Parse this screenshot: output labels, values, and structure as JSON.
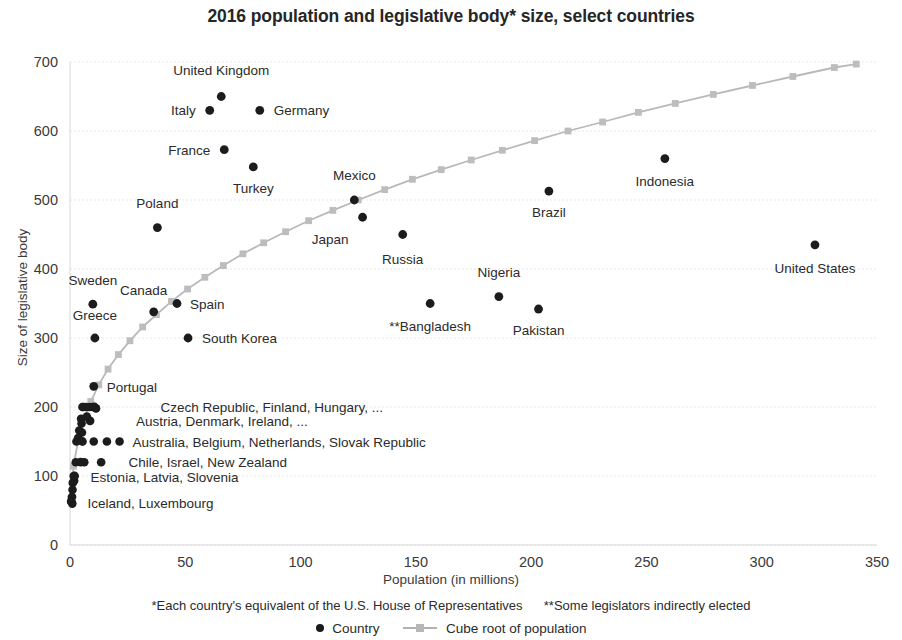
{
  "chart_data": {
    "type": "scatter",
    "title": "2016 population and legislative body* size, select countries",
    "xlabel": "Population (in millions)",
    "ylabel": "Size of legislative body",
    "xlim": [
      0,
      350
    ],
    "ylim": [
      0,
      700
    ],
    "xticks": [
      0,
      50,
      100,
      150,
      200,
      250,
      300,
      350
    ],
    "yticks": [
      0,
      100,
      200,
      300,
      400,
      500,
      600,
      700
    ],
    "grid": true,
    "legend_position": "bottom",
    "legend": [
      {
        "label": "Country",
        "marker": "dot",
        "color": "#1c1c1c"
      },
      {
        "label": "Cube root of population",
        "marker": "line-square",
        "color": "#bdbdbd"
      }
    ],
    "footnotes": [
      "*Each country's equivalent of the U.S. House of Representatives",
      "**Some legislators indirectly elected"
    ],
    "series": [
      {
        "name": "Country",
        "type": "scatter",
        "color": "#1c1c1c",
        "points": [
          {
            "label": "United Kingdom",
            "x": 65.6,
            "y": 650,
            "label_dx": 0,
            "label_dy": -22,
            "label_anchor": "middle"
          },
          {
            "label": "Italy",
            "x": 60.6,
            "y": 630,
            "label_dx": -14,
            "label_dy": 5,
            "label_anchor": "end"
          },
          {
            "label": "Germany",
            "x": 82.3,
            "y": 630,
            "label_dx": 14,
            "label_dy": 5,
            "label_anchor": "start"
          },
          {
            "label": "France",
            "x": 66.9,
            "y": 573,
            "label_dx": -14,
            "label_dy": 5,
            "label_anchor": "end"
          },
          {
            "label": "Turkey",
            "x": 79.5,
            "y": 548,
            "label_dx": 0,
            "label_dy": 26,
            "label_anchor": "middle"
          },
          {
            "label": "Poland",
            "x": 37.9,
            "y": 460,
            "label_dx": 0,
            "label_dy": -20,
            "label_anchor": "middle"
          },
          {
            "label": "Mexico",
            "x": 123.3,
            "y": 500,
            "label_dx": 0,
            "label_dy": -20,
            "label_anchor": "middle"
          },
          {
            "label": "Japan",
            "x": 126.9,
            "y": 475,
            "label_dx": -14,
            "label_dy": 27,
            "label_anchor": "end"
          },
          {
            "label": "Russia",
            "x": 144.3,
            "y": 450,
            "label_dx": 0,
            "label_dy": 29,
            "label_anchor": "middle"
          },
          {
            "label": "Brazil",
            "x": 207.7,
            "y": 513,
            "label_dx": 0,
            "label_dy": 26,
            "label_anchor": "middle"
          },
          {
            "label": "Indonesia",
            "x": 258.0,
            "y": 560,
            "label_dx": 0,
            "label_dy": 27,
            "label_anchor": "middle"
          },
          {
            "label": "United States",
            "x": 323.1,
            "y": 435,
            "label_dx": 0,
            "label_dy": 28,
            "label_anchor": "middle"
          },
          {
            "label": "Nigeria",
            "x": 186.0,
            "y": 360,
            "label_dx": 0,
            "label_dy": -20,
            "label_anchor": "middle"
          },
          {
            "label": "Pakistan",
            "x": 203.2,
            "y": 342,
            "label_dx": 0,
            "label_dy": 26,
            "label_anchor": "middle"
          },
          {
            "label": "**Bangladesh",
            "x": 156.2,
            "y": 350,
            "label_dx": 0,
            "label_dy": 27,
            "label_anchor": "middle"
          },
          {
            "label": "Sweden",
            "x": 9.9,
            "y": 349,
            "label_dx": 0,
            "label_dy": -19,
            "label_anchor": "middle"
          },
          {
            "label": "Canada",
            "x": 36.3,
            "y": 338,
            "label_dx": -10,
            "label_dy": -17,
            "label_anchor": "middle"
          },
          {
            "label": "Spain",
            "x": 46.4,
            "y": 350,
            "label_dx": 13,
            "label_dy": 5,
            "label_anchor": "start"
          },
          {
            "label": "Greece",
            "x": 10.8,
            "y": 300,
            "label_dx": 0,
            "label_dy": -18,
            "label_anchor": "middle"
          },
          {
            "label": "South Korea",
            "x": 51.2,
            "y": 300,
            "label_dx": 14,
            "label_dy": 5,
            "label_anchor": "start"
          },
          {
            "label": "Portugal",
            "x": 10.3,
            "y": 230,
            "label_dx": 13,
            "label_dy": 6,
            "label_anchor": "start"
          },
          {
            "label": "Czech Republic, Finland, Hungary, ...",
            "x": 10.6,
            "y": 200,
            "label_dx": 66,
            "label_dy": 5,
            "label_anchor": "start"
          },
          {
            "label": "Austria, Denmark, Ireland, ...",
            "x": 8.7,
            "y": 180,
            "label_dx": 46,
            "label_dy": 5,
            "label_anchor": "start"
          },
          {
            "label": "Australia, Belgium, Netherlands, Slovak Republic",
            "x": 5.4,
            "y": 150,
            "label_dx": 50,
            "label_dy": 5,
            "label_anchor": "start"
          },
          {
            "label": "Chile, Israel, New Zealand",
            "x": 4.6,
            "y": 120,
            "label_dx": 48,
            "label_dy": 5,
            "label_anchor": "start"
          },
          {
            "label": "Estonia, Latvia, Slovenia",
            "x": 2.0,
            "y": 100,
            "label_dx": 16,
            "label_dy": 6,
            "label_anchor": "start"
          },
          {
            "label": "Iceland, Luxembourg",
            "x": 0.6,
            "y": 63,
            "label_dx": 16,
            "label_dy": 6,
            "label_anchor": "start"
          }
        ],
        "extra_points": [
          {
            "x": 5.7,
            "y": 200
          },
          {
            "x": 5.4,
            "y": 200
          },
          {
            "x": 8.5,
            "y": 200
          },
          {
            "x": 9.9,
            "y": 200
          },
          {
            "x": 7.0,
            "y": 200
          },
          {
            "x": 11.3,
            "y": 198
          },
          {
            "x": 4.8,
            "y": 183
          },
          {
            "x": 7.3,
            "y": 186
          },
          {
            "x": 5.0,
            "y": 176
          },
          {
            "x": 4.0,
            "y": 166
          },
          {
            "x": 5.2,
            "y": 163
          },
          {
            "x": 3.5,
            "y": 155
          },
          {
            "x": 2.8,
            "y": 150
          },
          {
            "x": 10.3,
            "y": 150
          },
          {
            "x": 16.0,
            "y": 150
          },
          {
            "x": 21.5,
            "y": 150
          },
          {
            "x": 2.5,
            "y": 120
          },
          {
            "x": 6.2,
            "y": 120
          },
          {
            "x": 13.5,
            "y": 120
          },
          {
            "x": 1.6,
            "y": 100
          },
          {
            "x": 1.8,
            "y": 93
          },
          {
            "x": 1.2,
            "y": 90
          },
          {
            "x": 1.1,
            "y": 80
          },
          {
            "x": 0.9,
            "y": 70
          },
          {
            "x": 0.5,
            "y": 63
          },
          {
            "x": 1.0,
            "y": 60
          }
        ]
      },
      {
        "name": "Cube root of population",
        "type": "line",
        "color": "#bdbdbd",
        "points": [
          {
            "x": 0.3,
            "y": 67
          },
          {
            "x": 1.5,
            "y": 114
          },
          {
            "x": 3.5,
            "y": 151
          },
          {
            "x": 6.0,
            "y": 181
          },
          {
            "x": 9.0,
            "y": 208
          },
          {
            "x": 12.5,
            "y": 232
          },
          {
            "x": 16.5,
            "y": 255
          },
          {
            "x": 21.0,
            "y": 276
          },
          {
            "x": 26.0,
            "y": 296
          },
          {
            "x": 31.5,
            "y": 316
          },
          {
            "x": 37.5,
            "y": 334
          },
          {
            "x": 44.0,
            "y": 353
          },
          {
            "x": 51.0,
            "y": 371
          },
          {
            "x": 58.5,
            "y": 388
          },
          {
            "x": 66.5,
            "y": 405
          },
          {
            "x": 75.0,
            "y": 422
          },
          {
            "x": 84.0,
            "y": 438
          },
          {
            "x": 93.5,
            "y": 454
          },
          {
            "x": 103.5,
            "y": 470
          },
          {
            "x": 114.0,
            "y": 485
          },
          {
            "x": 125.0,
            "y": 500
          },
          {
            "x": 136.5,
            "y": 515
          },
          {
            "x": 148.5,
            "y": 530
          },
          {
            "x": 161.0,
            "y": 544
          },
          {
            "x": 174.0,
            "y": 558
          },
          {
            "x": 187.5,
            "y": 572
          },
          {
            "x": 201.5,
            "y": 586
          },
          {
            "x": 216.0,
            "y": 600
          },
          {
            "x": 231.0,
            "y": 613
          },
          {
            "x": 246.5,
            "y": 627
          },
          {
            "x": 262.5,
            "y": 640
          },
          {
            "x": 279.0,
            "y": 653
          },
          {
            "x": 296.0,
            "y": 666
          },
          {
            "x": 313.5,
            "y": 679
          },
          {
            "x": 331.5,
            "y": 692
          },
          {
            "x": 341.0,
            "y": 697
          }
        ]
      }
    ]
  }
}
